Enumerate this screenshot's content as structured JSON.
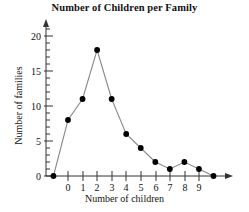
{
  "chart_data": {
    "type": "line",
    "title": "Number of Children per Family",
    "xlabel": "Number of children",
    "ylabel": "Number of families",
    "categories": [
      0,
      1,
      2,
      3,
      4,
      5,
      6,
      7,
      8,
      9
    ],
    "values": [
      8,
      11,
      18,
      11,
      6,
      4,
      2,
      1,
      2,
      1
    ],
    "x": [
      -1,
      0,
      1,
      2,
      3,
      4,
      5,
      6,
      7,
      8,
      9,
      10
    ],
    "y": [
      0,
      8,
      11,
      18,
      11,
      6,
      4,
      2,
      1,
      2,
      1,
      0
    ],
    "xlim": [
      -1,
      10
    ],
    "ylim": [
      0,
      21
    ],
    "xtick_labels": [
      "0",
      "1",
      "2",
      "3",
      "4",
      "5",
      "6",
      "7",
      "8",
      "9"
    ],
    "ytick_labels": [
      "0",
      "5",
      "10",
      "15",
      "20"
    ],
    "ytick_values": [
      0,
      5,
      10,
      15,
      20
    ],
    "yminor_step": 1,
    "grid": false,
    "legend": false,
    "marker": "filled-circle",
    "marker_color": "#000000",
    "line_color": "#8a8a8a",
    "axis_color": "#333333",
    "background": "#ffffff"
  }
}
